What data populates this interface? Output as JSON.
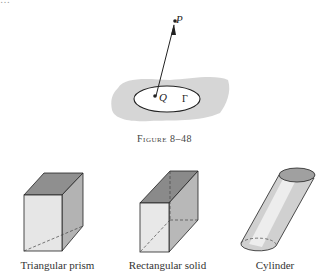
{
  "page": {
    "top_text_fragment": "…"
  },
  "figure_8_48": {
    "caption": "Figure 8–48",
    "labels": {
      "point_p": "P",
      "point_q": "Q",
      "region": "Γ"
    }
  },
  "solids": [
    {
      "label": "Triangular prism"
    },
    {
      "label": "Rectangular solid"
    },
    {
      "label": "Cylinder"
    }
  ]
}
